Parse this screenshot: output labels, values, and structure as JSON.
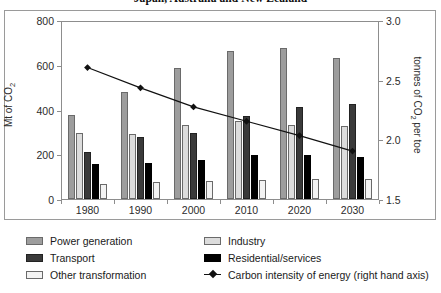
{
  "chart_data": {
    "type": "bar",
    "title": "Japan, Australia and New Zealand",
    "xlabel": "",
    "ylabel": "Mt of CO2",
    "ylabel_rich": "Mt of CO₂",
    "y2label": "tonnes of CO2 per toe",
    "y2label_rich": "tonnes of CO₂ per toe",
    "categories": [
      "1980",
      "1990",
      "2000",
      "2010",
      "2020",
      "2030"
    ],
    "ylim": [
      0,
      800
    ],
    "yticks": [
      0,
      200,
      400,
      600,
      800
    ],
    "y2lim": [
      1.5,
      3.0
    ],
    "y2ticks": [
      1.5,
      2.0,
      2.5,
      3.0
    ],
    "grid": false,
    "legend_position": "bottom",
    "series": [
      {
        "name": "Power generation",
        "color": "#9d9d9d",
        "axis": "left",
        "values": [
          375,
          480,
          585,
          660,
          675,
          630
        ]
      },
      {
        "name": "Industry",
        "color": "#dcdcdc",
        "axis": "left",
        "values": [
          295,
          290,
          330,
          350,
          330,
          325
        ]
      },
      {
        "name": "Transport",
        "color": "#3a3a3a",
        "axis": "left",
        "values": [
          210,
          275,
          295,
          370,
          410,
          425
        ]
      },
      {
        "name": "Residential/services",
        "color": "#000000",
        "axis": "left",
        "values": [
          155,
          160,
          175,
          195,
          195,
          190
        ]
      },
      {
        "name": "Other transformation",
        "color": "#f3f3f3",
        "axis": "left",
        "values": [
          65,
          75,
          80,
          85,
          88,
          90
        ]
      },
      {
        "name": "Carbon intensity of energy (right hand axis)",
        "color": "#111111",
        "axis": "right",
        "type": "line",
        "values": [
          2.61,
          2.44,
          2.28,
          2.16,
          2.04,
          1.91
        ]
      }
    ]
  },
  "title": {
    "text": "Japan, Australia and New Zealand"
  },
  "axes": {
    "left": {
      "title_pre": "Mt of CO",
      "title_sub": "2",
      "ticks": [
        "800",
        "600",
        "400",
        "200",
        "0"
      ]
    },
    "right": {
      "title_pre": "tonnes of CO",
      "title_sub": "2",
      "title_post": " per toe",
      "ticks": [
        "3.0",
        "2.5",
        "2.0",
        "1.5"
      ]
    },
    "x": {
      "ticks": [
        "1980",
        "1990",
        "2000",
        "2010",
        "2020",
        "2030"
      ]
    }
  },
  "legend": {
    "col_a": [
      {
        "label": "Power generation",
        "icon": "swatch-power"
      },
      {
        "label": "Transport",
        "icon": "swatch-transport"
      },
      {
        "label": "Other transformation",
        "icon": "swatch-other"
      }
    ],
    "col_b": [
      {
        "label": "Industry",
        "icon": "swatch-industry"
      },
      {
        "label": "Residential/services",
        "icon": "swatch-residential"
      },
      {
        "label": "Carbon intensity of energy (right hand axis)",
        "icon": "line-diamond-marker"
      }
    ]
  }
}
